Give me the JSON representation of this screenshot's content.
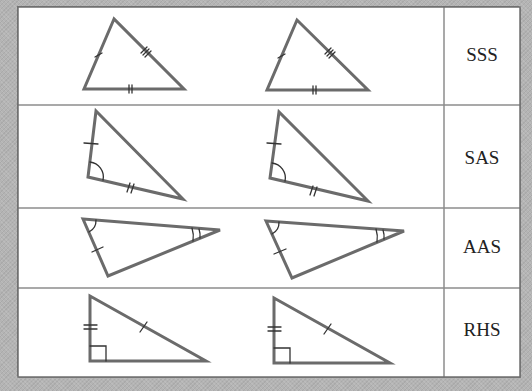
{
  "colors": {
    "triangle_stroke": "#6b6b6b",
    "grid_line": "#8c8c8c",
    "background": "#b4b4b4",
    "table_bg": "#ffffff",
    "label_text": "#222222"
  },
  "rows": [
    {
      "label": "SSS",
      "meaning": "three pairs of equal sides",
      "triangles": [
        {
          "points": [
            [
              114,
              19
            ],
            [
              84,
              89
            ],
            [
              184,
              89
            ]
          ]
        },
        {
          "points": [
            [
              297,
              20
            ],
            [
              267,
              90
            ],
            [
              368,
              90
            ]
          ]
        }
      ]
    },
    {
      "label": "SAS",
      "meaning": "two sides and included angle",
      "triangles": [
        {
          "points": [
            [
              96,
              111
            ],
            [
              88,
              177
            ],
            [
              183,
              199
            ]
          ]
        },
        {
          "points": [
            [
              279,
              112
            ],
            [
              270,
              178
            ],
            [
              368,
              201
            ]
          ]
        }
      ]
    },
    {
      "label": "AAS",
      "meaning": "two angles and a side",
      "triangles": [
        {
          "points": [
            [
              83,
              219
            ],
            [
              220,
              230
            ],
            [
              108,
              276
            ]
          ]
        },
        {
          "points": [
            [
              266,
              221
            ],
            [
              404,
              231
            ],
            [
              292,
              278
            ]
          ]
        }
      ]
    },
    {
      "label": "RHS",
      "meaning": "right angle, hypotenuse, side",
      "triangles": [
        {
          "points": [
            [
              90,
              296
            ],
            [
              90,
              361
            ],
            [
              206,
              361
            ]
          ]
        },
        {
          "points": [
            [
              274,
              298
            ],
            [
              274,
              363
            ],
            [
              390,
              363
            ]
          ]
        }
      ]
    }
  ]
}
